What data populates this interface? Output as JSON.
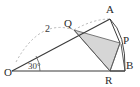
{
  "figure": {
    "kind": "geometry-diagram",
    "background_color": "#ffffff",
    "stroke_color": "#3a3a3a",
    "dashed_stroke_color": "#9a9a9a",
    "shaded_fill_color": "#d6d6d6",
    "shaded_stroke_color": "#5a5a5a"
  },
  "points": [
    {
      "id": "O",
      "label": "O",
      "x": 12,
      "y": 71,
      "label_x": 4,
      "label_y": 76
    },
    {
      "id": "A",
      "label": "A",
      "x": 110,
      "y": 19,
      "label_x": 108,
      "label_y": 12
    },
    {
      "id": "Q",
      "label": "Q",
      "x": 74,
      "y": 30,
      "label_x": 68,
      "label_y": 26
    },
    {
      "id": "P",
      "label": "P",
      "x": 120,
      "y": 43,
      "label_x": 124,
      "label_y": 44
    },
    {
      "id": "R",
      "label": "R",
      "x": 110,
      "y": 71,
      "label_x": 106,
      "label_y": 84
    },
    {
      "id": "B",
      "label": "B",
      "x": 125,
      "y": 71,
      "label_x": 126,
      "label_y": 70
    }
  ],
  "segments": [
    {
      "id": "OB",
      "from": "O",
      "to": "B",
      "style": "solid"
    },
    {
      "id": "OA",
      "from": "O",
      "to": "A",
      "style": "solid"
    },
    {
      "id": "AP",
      "from": "A",
      "to": "P",
      "style": "solid"
    },
    {
      "id": "RB",
      "from": "R",
      "to": "B",
      "style": "solid"
    },
    {
      "id": "QR",
      "from": "Q",
      "to": "R",
      "style": "solid"
    }
  ],
  "arcs": [
    {
      "id": "radius-arc-dashed",
      "style": "dashed",
      "description": "dashed arc of radius 2 from baseline near O sweeping through Q up to A"
    },
    {
      "id": "arc-A-P-B",
      "style": "solid",
      "description": "solid arc from A through P down to B"
    },
    {
      "id": "angle-arc-30",
      "style": "solid",
      "description": "small angle arc at vertex O marking 30 degrees"
    }
  ],
  "shaded_region": {
    "id": "region-QPR",
    "vertices": [
      "Q",
      "P",
      "R"
    ],
    "fill": "#d6d6d6"
  },
  "labels": {
    "radius": "2",
    "angle": "30°",
    "vertex_O": "O",
    "vertex_A": "A",
    "vertex_Q": "Q",
    "vertex_P": "P",
    "vertex_R": "R",
    "vertex_B": "B"
  }
}
